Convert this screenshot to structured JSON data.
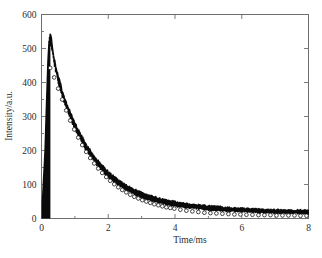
{
  "figure": {
    "background_color": "#ffffff",
    "frame_color": "#6e6e6e",
    "data_color": "#0a0a0a",
    "marker_fill_color": "#ffffff"
  },
  "axes": {
    "y_label": "Intensity/a.u.",
    "x_label": "Time/ms",
    "y_ticks": [
      "0",
      "100",
      "200",
      "300",
      "400",
      "500",
      "600"
    ],
    "x_ticks": [
      "0",
      "2",
      "4",
      "6",
      "8"
    ]
  },
  "chart_data": {
    "type": "line",
    "title": "",
    "subtitle": "",
    "xlabel": "Time/ms",
    "ylabel": "Intensity/a.u.",
    "xlim": [
      0,
      8
    ],
    "ylim": [
      0,
      600
    ],
    "xticks": [
      0,
      2,
      4,
      6,
      8
    ],
    "xticks_minor": [
      1,
      3,
      5,
      7
    ],
    "yticks": [
      0,
      100,
      200,
      300,
      400,
      500,
      600
    ],
    "yticks_minor": [
      50,
      150,
      250,
      350,
      450,
      550
    ],
    "grid": false,
    "legend": null,
    "legend_position": "none",
    "annotations": [],
    "series": [
      {
        "name": "Measured decay (noisy)",
        "style": "noisy-band",
        "color": "#0a0a0a",
        "x": [
          0.0,
          0.1,
          0.18,
          0.22,
          0.26,
          0.3,
          0.36,
          0.44,
          0.52,
          0.6,
          0.7,
          0.8,
          0.9,
          1.0,
          1.1,
          1.2,
          1.3,
          1.4,
          1.5,
          1.6,
          1.7,
          1.8,
          1.9,
          2.0,
          2.1,
          2.2,
          2.3,
          2.4,
          2.5,
          2.6,
          2.7,
          2.8,
          2.9,
          3.0,
          3.1,
          3.2,
          3.3,
          3.4,
          3.5,
          3.6,
          3.7,
          3.8,
          3.9,
          4.0,
          4.2,
          4.4,
          4.6,
          4.8,
          5.0,
          5.2,
          5.4,
          5.6,
          5.8,
          6.0,
          6.2,
          6.4,
          6.6,
          6.8,
          7.0,
          7.2,
          7.4,
          7.6,
          7.8,
          8.0
        ],
        "y": [
          8,
          190,
          430,
          505,
          525,
          512,
          470,
          432,
          400,
          372,
          340,
          315,
          292,
          270,
          250,
          232,
          214,
          199,
          184,
          171,
          159,
          148,
          137,
          128,
          119,
          111,
          104,
          97,
          91,
          85,
          80,
          75,
          71,
          67,
          63,
          60,
          57,
          54,
          51,
          49,
          47,
          45,
          43,
          41,
          38,
          35,
          33,
          31,
          29,
          28,
          26,
          25,
          24,
          23,
          22,
          21,
          20,
          20,
          19,
          19,
          18,
          18,
          18,
          17
        ],
        "noise_amplitude": [
          0,
          14,
          20,
          22,
          22,
          22,
          21,
          20,
          20,
          19,
          19,
          18,
          18,
          18,
          17,
          17,
          17,
          16,
          16,
          16,
          16,
          15,
          15,
          15,
          15,
          14,
          14,
          14,
          14,
          14,
          13,
          13,
          13,
          13,
          13,
          13,
          12,
          12,
          12,
          12,
          12,
          12,
          12,
          12,
          11,
          11,
          11,
          11,
          11,
          11,
          11,
          10,
          10,
          10,
          10,
          10,
          10,
          10,
          10,
          10,
          10,
          10,
          10,
          10
        ]
      },
      {
        "name": "Fitted decay",
        "style": "open-circle-markers",
        "color": "#0a0a0a",
        "marker_fill": "#ffffff",
        "x": [
          0.26,
          0.38,
          0.5,
          0.62,
          0.74,
          0.86,
          0.98,
          1.1,
          1.22,
          1.34,
          1.46,
          1.58,
          1.7,
          1.82,
          1.94,
          2.06,
          2.18,
          2.3,
          2.42,
          2.54,
          2.66,
          2.78,
          2.9,
          3.02,
          3.14,
          3.26,
          3.38,
          3.5,
          3.62,
          3.74,
          3.86,
          3.98,
          4.16,
          4.34,
          4.52,
          4.7,
          4.88,
          5.06,
          5.24,
          5.42,
          5.6,
          5.78,
          5.96,
          6.14,
          6.32,
          6.5,
          6.68,
          6.86,
          7.04,
          7.22,
          7.4,
          7.58,
          7.76,
          7.94
        ],
        "y": [
          443,
          415,
          382,
          350,
          318,
          288,
          262,
          238,
          216,
          196,
          178,
          162,
          147,
          134,
          122,
          111,
          101,
          92,
          84,
          77,
          70,
          64,
          59,
          54,
          50,
          46,
          42,
          39,
          36,
          33,
          31,
          29,
          26,
          23,
          21,
          19,
          17,
          16,
          15,
          14,
          13,
          12,
          12,
          11,
          11,
          10,
          10,
          10,
          9,
          9,
          9,
          9,
          8,
          8
        ]
      }
    ]
  }
}
